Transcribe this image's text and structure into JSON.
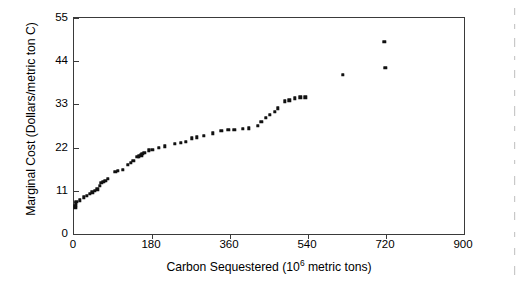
{
  "chart_data": {
    "type": "scatter",
    "title": "",
    "xlabel": "Carbon Sequestered (10⁶ metric tons)",
    "xlabel_main": "Carbon Sequestered (10",
    "xlabel_sup": "6",
    "xlabel_tail": " metric tons)",
    "ylabel": "Marginal Cost (Dollars/metric ton C)",
    "xlim": [
      0,
      900
    ],
    "ylim": [
      0,
      55
    ],
    "xticks": [
      0,
      180,
      360,
      540,
      720,
      900
    ],
    "yticks": [
      0,
      11,
      22,
      33,
      44,
      55
    ],
    "grid": false,
    "legend": null,
    "marker": "square",
    "marker_color": "#111111",
    "axis_color": "#3a3a3a",
    "background": "#ffffff",
    "series": [
      {
        "name": "Marginal cost of carbon sequestration",
        "points": [
          [
            3,
            6.6
          ],
          [
            3,
            7.2
          ],
          [
            4,
            7.8
          ],
          [
            5,
            8.2
          ],
          [
            14,
            8.6
          ],
          [
            22,
            9.3
          ],
          [
            30,
            9.8
          ],
          [
            36,
            10.2
          ],
          [
            42,
            10.6
          ],
          [
            48,
            11.0
          ],
          [
            54,
            11.4
          ],
          [
            60,
            12.2
          ],
          [
            63,
            13.0
          ],
          [
            68,
            13.3
          ],
          [
            72,
            13.5
          ],
          [
            78,
            14.0
          ],
          [
            95,
            15.9
          ],
          [
            101,
            16.1
          ],
          [
            112,
            16.4
          ],
          [
            124,
            17.6
          ],
          [
            131,
            18.2
          ],
          [
            137,
            18.6
          ],
          [
            146,
            19.6
          ],
          [
            150,
            19.8
          ],
          [
            155,
            20.0
          ],
          [
            158,
            20.4
          ],
          [
            162,
            20.6
          ],
          [
            172,
            21.3
          ],
          [
            181,
            21.5
          ],
          [
            195,
            22.0
          ],
          [
            210,
            22.3
          ],
          [
            232,
            23.0
          ],
          [
            246,
            23.2
          ],
          [
            258,
            23.5
          ],
          [
            272,
            24.4
          ],
          [
            284,
            24.6
          ],
          [
            300,
            25.0
          ],
          [
            320,
            25.6
          ],
          [
            340,
            26.3
          ],
          [
            356,
            26.6
          ],
          [
            370,
            26.6
          ],
          [
            389,
            26.8
          ],
          [
            404,
            26.9
          ],
          [
            424,
            27.6
          ],
          [
            432,
            28.6
          ],
          [
            442,
            29.6
          ],
          [
            452,
            30.3
          ],
          [
            463,
            31.1
          ],
          [
            470,
            32.0
          ],
          [
            487,
            33.8
          ],
          [
            497,
            34.0
          ],
          [
            510,
            34.6
          ],
          [
            522,
            34.8
          ],
          [
            534,
            34.8
          ],
          [
            620,
            40.6
          ],
          [
            716,
            49.0
          ],
          [
            718,
            42.3
          ]
        ]
      }
    ]
  }
}
